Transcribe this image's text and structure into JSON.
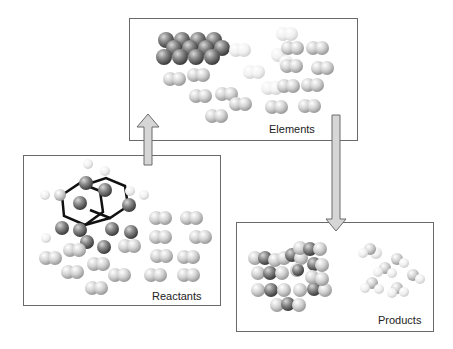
{
  "diagram": {
    "panels": {
      "elements": {
        "label": "Elements"
      },
      "reactants": {
        "label": "Reactants"
      },
      "products": {
        "label": "Products"
      }
    },
    "arrows": [
      {
        "from": "reactants",
        "to": "elements",
        "direction": "up"
      },
      {
        "from": "elements",
        "to": "products",
        "direction": "down"
      }
    ],
    "colors": {
      "panel_border": "#6a6a6a",
      "arrow_fill": "#d6d6d6",
      "carbon_atom": "#7a7a7a",
      "light_atom": "#cfcfcf",
      "hydrogen_atom": "#f2f2f2"
    }
  }
}
